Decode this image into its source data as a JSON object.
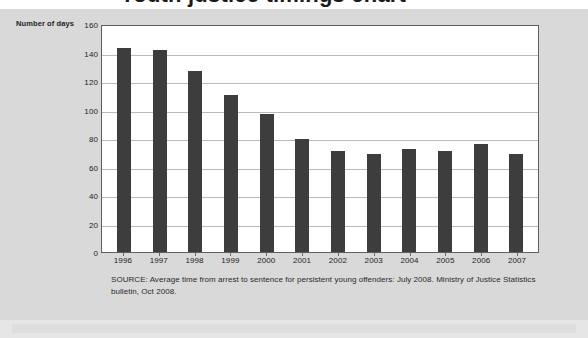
{
  "page": {
    "headline_partial": "Youth justice timings chart",
    "background_color": "#d9d9d9"
  },
  "axis_title": "Number of days",
  "source_note": "SOURCE: Average time from arrest to sentence for persistent young offenders: July 2008. Ministry of Justice Statistics bulletin, Oct 2008.",
  "chart_data": {
    "type": "bar",
    "title": "",
    "subtitle": "",
    "xlabel": "",
    "ylabel": "Number of days",
    "ylim": [
      0,
      160
    ],
    "yticks": [
      160,
      140,
      120,
      100,
      80,
      60,
      40,
      20,
      0
    ],
    "grid": true,
    "legend": null,
    "bar_color": "#3d3d3d",
    "plot_background": "#ffffff",
    "gridline_color": "#b9b9b9",
    "categories": [
      "1996",
      "1997",
      "1998",
      "1999",
      "2000",
      "2001",
      "2002",
      "2003",
      "2004",
      "2005",
      "2006",
      "2007"
    ],
    "values": [
      143,
      142,
      127,
      110,
      97,
      79,
      71,
      69,
      72,
      71,
      76,
      69
    ],
    "annotations": []
  }
}
